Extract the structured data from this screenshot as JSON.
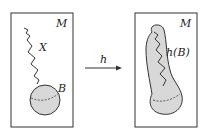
{
  "left_panel": {
    "manifold_label": "M",
    "path_label": "X",
    "ball_label": "B"
  },
  "arrow": {
    "label": "h"
  },
  "right_panel": {
    "manifold_label": "M",
    "image_label": "h(B)"
  },
  "colors": {
    "stroke": "#333333",
    "fill": "#d8d8d8",
    "background": "#ffffff"
  }
}
